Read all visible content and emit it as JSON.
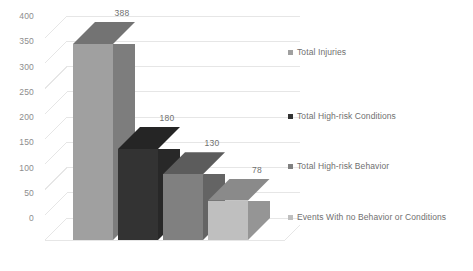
{
  "chart_data": {
    "type": "bar",
    "title": "",
    "subtitle": "",
    "xlabel": "",
    "ylabel": "",
    "categories": [
      "Total Injuries",
      "Total High-risk Conditions",
      "Total High-risk Behavior",
      "Events With no Behavior or Conditions"
    ],
    "values": [
      388,
      180,
      130,
      78
    ],
    "data_labels": [
      "388",
      "180",
      "130",
      "78"
    ],
    "ylim": [
      0,
      400
    ],
    "ytick_labels": [
      "400",
      "350",
      "300",
      "250",
      "200",
      "150",
      "100",
      "50",
      "0"
    ],
    "ytick_values": [
      400,
      350,
      300,
      250,
      200,
      150,
      100,
      50,
      0
    ],
    "grid": true,
    "legend_position": "right",
    "three_d": true,
    "series_colors": [
      "#a0a0a0",
      "#333333",
      "#808080",
      "#bfbfbf"
    ]
  },
  "legend": {
    "items": [
      {
        "label": "Total Injuries",
        "color": "#a0a0a0"
      },
      {
        "label": "Total High-risk Conditions",
        "color": "#333333"
      },
      {
        "label": "Total High-risk Behavior",
        "color": "#808080"
      },
      {
        "label": "Events With no Behavior or Conditions",
        "color": "#bfbfbf"
      }
    ]
  },
  "colors": {
    "gridline": "#e6e6e6",
    "tick_text": "#8d8d8d",
    "label_text": "#6f6f6f",
    "background": "#ffffff"
  }
}
